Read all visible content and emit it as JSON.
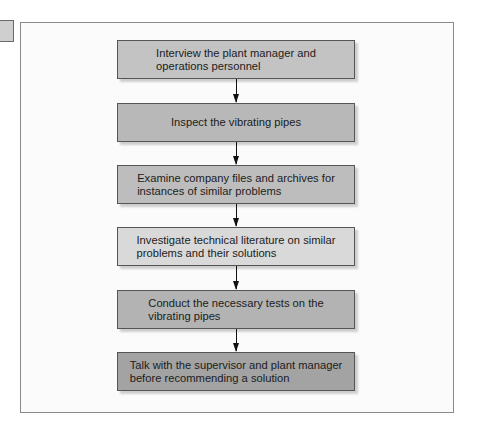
{
  "diagram": {
    "type": "flowchart",
    "direction": "top-to-bottom",
    "steps": [
      {
        "label": "Interview the plant manager and\noperations personnel",
        "fill": "#c3c3c3"
      },
      {
        "label": "Inspect the vibrating pipes",
        "fill": "#b8b8b8"
      },
      {
        "label": "Examine company files and archives for\ninstances of similar problems",
        "fill": "#bdbdbd"
      },
      {
        "label": "Investigate technical literature on similar\nproblems and their solutions",
        "fill": "#d9d9d9"
      },
      {
        "label": "Conduct the necessary tests on the\nvibrating pipes",
        "fill": "#b3b3b3"
      },
      {
        "label": "Talk with the supervisor and plant manager\nbefore recommending a solution",
        "fill": "#a3a3a3"
      }
    ],
    "connectors": [
      {
        "from": 0,
        "to": 1
      },
      {
        "from": 1,
        "to": 2
      },
      {
        "from": 2,
        "to": 3
      },
      {
        "from": 3,
        "to": 4
      },
      {
        "from": 4,
        "to": 5
      }
    ]
  }
}
